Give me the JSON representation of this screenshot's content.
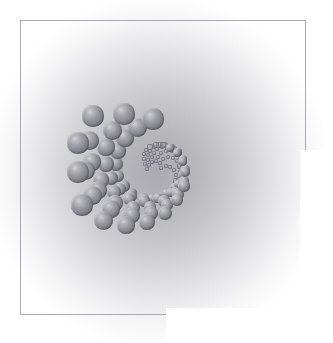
{
  "figure": {
    "type": "optical-illusion-figure",
    "canvas": {
      "width": 333,
      "height": 343,
      "background": "#ffffff"
    },
    "frame": {
      "x": 20,
      "y": 20,
      "width": 286,
      "height": 295,
      "stroke": "#a9a9ae",
      "stroke_width": 1,
      "note": "partial frame; lower-right portion of the border is not drawn"
    },
    "background_haze": {
      "type": "radial-gradient",
      "center_x": 158,
      "center_y": 172,
      "radius": 150,
      "inner_color": "#b2b2b7",
      "outer_color": "#ffffff"
    },
    "sphere_style": {
      "highlight_color": "#cfcfd4",
      "body_color": "#9a9aa1",
      "shadow_color": "#6b6b73",
      "highlight_offset_x_pct": 36,
      "highlight_offset_y_pct": 31
    }
  },
  "chart_data": {
    "type": "scatter",
    "xlabel": "",
    "ylabel": "",
    "xlim": [
      0,
      333
    ],
    "ylim": [
      0,
      343
    ],
    "grid": false,
    "legend": null,
    "encoding": {
      "x": "px",
      "y": "px",
      "size": "radius in px grows with radial distance from centre"
    },
    "center": [
      158,
      172
    ],
    "arm_count": 6,
    "points_per_arm": 19,
    "series": [
      {
        "name": "spiral-spheres",
        "note": "each point: [cx, cy, r]",
        "points": [
          [
            161,
            168,
            1.6
          ],
          [
            166,
            166,
            1.8
          ],
          [
            170,
            167,
            1.9
          ],
          [
            174,
            170,
            2.1
          ],
          [
            176,
            175,
            2.3
          ],
          [
            176,
            181,
            2.6
          ],
          [
            173,
            187,
            2.9
          ],
          [
            168,
            192,
            3.2
          ],
          [
            161,
            196,
            3.6
          ],
          [
            152,
            198,
            4.0
          ],
          [
            142,
            197,
            4.5
          ],
          [
            132,
            193,
            5.0
          ],
          [
            124,
            186,
            5.6
          ],
          [
            118,
            176,
            6.2
          ],
          [
            116,
            164,
            6.9
          ],
          [
            118,
            151,
            7.7
          ],
          [
            125,
            138,
            8.6
          ],
          [
            137,
            127,
            9.5
          ],
          [
            153,
            119,
            10.6
          ],
          [
            160,
            163,
            1.6
          ],
          [
            163,
            159,
            1.8
          ],
          [
            168,
            157,
            1.9
          ],
          [
            173,
            158,
            2.1
          ],
          [
            177,
            161,
            2.3
          ],
          [
            180,
            166,
            2.6
          ],
          [
            181,
            172,
            2.9
          ],
          [
            179,
            180,
            3.2
          ],
          [
            174,
            187,
            3.6
          ],
          [
            166,
            193,
            4.0
          ],
          [
            156,
            198,
            4.5
          ],
          [
            144,
            199,
            5.0
          ],
          [
            131,
            196,
            5.6
          ],
          [
            120,
            189,
            6.2
          ],
          [
            111,
            178,
            6.9
          ],
          [
            106,
            164,
            7.7
          ],
          [
            106,
            147,
            8.6
          ],
          [
            112,
            130,
            9.5
          ],
          [
            124,
            114,
            10.6
          ],
          [
            156,
            161,
            1.6
          ],
          [
            158,
            157,
            1.8
          ],
          [
            161,
            153,
            1.9
          ],
          [
            166,
            151,
            2.1
          ],
          [
            172,
            151,
            2.3
          ],
          [
            177,
            154,
            2.6
          ],
          [
            181,
            159,
            2.9
          ],
          [
            183,
            166,
            3.2
          ],
          [
            182,
            175,
            3.6
          ],
          [
            178,
            184,
            4.0
          ],
          [
            170,
            192,
            4.5
          ],
          [
            158,
            198,
            5.0
          ],
          [
            144,
            201,
            5.6
          ],
          [
            129,
            199,
            6.2
          ],
          [
            114,
            192,
            6.9
          ],
          [
            101,
            180,
            7.7
          ],
          [
            92,
            162,
            8.6
          ],
          [
            89,
            140,
            9.5
          ],
          [
            93,
            116,
            10.6
          ],
          [
            152,
            162,
            1.6
          ],
          [
            152,
            157,
            1.8
          ],
          [
            154,
            153,
            1.9
          ],
          [
            157,
            149,
            2.1
          ],
          [
            162,
            147,
            2.3
          ],
          [
            168,
            147,
            2.6
          ],
          [
            174,
            149,
            2.9
          ],
          [
            179,
            154,
            3.2
          ],
          [
            183,
            161,
            3.6
          ],
          [
            184,
            170,
            4.0
          ],
          [
            182,
            181,
            4.5
          ],
          [
            175,
            192,
            5.0
          ],
          [
            164,
            201,
            5.6
          ],
          [
            150,
            207,
            6.2
          ],
          [
            133,
            208,
            6.9
          ],
          [
            115,
            203,
            7.7
          ],
          [
            98,
            190,
            8.6
          ],
          [
            85,
            170,
            9.5
          ],
          [
            78,
            143,
            10.6
          ],
          [
            149,
            165,
            1.6
          ],
          [
            148,
            160,
            1.8
          ],
          [
            148,
            155,
            1.9
          ],
          [
            150,
            151,
            2.1
          ],
          [
            154,
            147,
            2.3
          ],
          [
            159,
            145,
            2.6
          ],
          [
            165,
            145,
            2.9
          ],
          [
            172,
            147,
            3.2
          ],
          [
            178,
            152,
            3.6
          ],
          [
            183,
            159,
            4.0
          ],
          [
            185,
            169,
            4.5
          ],
          [
            184,
            181,
            5.0
          ],
          [
            178,
            194,
            5.6
          ],
          [
            167,
            205,
            6.2
          ],
          [
            151,
            213,
            6.9
          ],
          [
            132,
            215,
            7.7
          ],
          [
            111,
            209,
            8.6
          ],
          [
            92,
            195,
            9.5
          ],
          [
            78,
            172,
            10.6
          ],
          [
            147,
            169,
            1.6
          ],
          [
            145,
            164,
            1.8
          ],
          [
            144,
            159,
            1.9
          ],
          [
            144,
            154,
            2.1
          ],
          [
            146,
            150,
            2.3
          ],
          [
            150,
            147,
            2.6
          ],
          [
            156,
            145,
            2.9
          ],
          [
            163,
            145,
            3.2
          ],
          [
            170,
            148,
            3.6
          ],
          [
            177,
            153,
            4.0
          ],
          [
            182,
            161,
            4.5
          ],
          [
            185,
            172,
            5.0
          ],
          [
            184,
            186,
            5.6
          ],
          [
            177,
            200,
            6.2
          ],
          [
            165,
            213,
            6.9
          ],
          [
            147,
            222,
            7.7
          ],
          [
            126,
            225,
            8.6
          ],
          [
            103,
            220,
            9.5
          ],
          [
            82,
            205,
            10.6
          ]
        ]
      }
    ]
  }
}
